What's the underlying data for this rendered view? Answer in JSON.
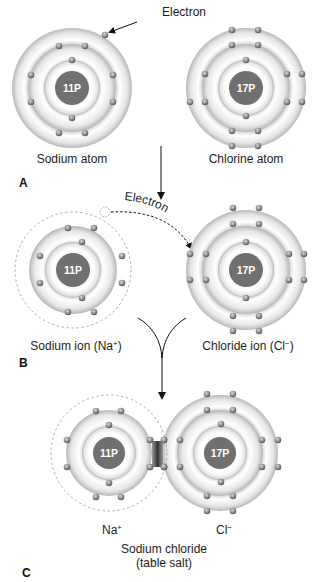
{
  "figure": {
    "panels": [
      {
        "letter": "A",
        "atoms": [
          {
            "label": "Sodium atom",
            "nucleus": "11P",
            "shells": [
              2,
              8,
              1
            ]
          },
          {
            "label": "Chlorine atom",
            "nucleus": "17P",
            "shells": [
              2,
              8,
              7
            ]
          }
        ],
        "callout": "Electron"
      },
      {
        "letter": "B",
        "atoms": [
          {
            "label": "Sodium ion (Na+)",
            "nucleus": "11P",
            "shells": [
              2,
              8
            ]
          },
          {
            "label": "Chloride ion (Cl−)",
            "nucleus": "17P",
            "shells": [
              2,
              8,
              8
            ]
          }
        ],
        "transfer_label": "Electron"
      },
      {
        "letter": "C",
        "atoms": [
          {
            "label": "Na+",
            "nucleus": "11P",
            "shells": [
              2,
              8
            ]
          },
          {
            "label": "Cl−",
            "nucleus": "17P",
            "shells": [
              2,
              8,
              8
            ]
          }
        ],
        "compound_label": "Sodium chloride",
        "compound_sublabel": "(table salt)"
      }
    ]
  },
  "labels": {
    "electron_callout": "Electron",
    "sodium_atom": "Sodium atom",
    "chlorine_atom": "Chlorine atom",
    "panel_a": "A",
    "electron_transfer": "Electron",
    "sodium_ion_text": "Sodium ion (Na",
    "sodium_ion_sup": "+",
    "sodium_ion_close": ")",
    "chloride_ion_text": "Chloride ion (Cl",
    "chloride_ion_sup": "−",
    "chloride_ion_close": ")",
    "panel_b": "B",
    "na_text": "Na",
    "na_sup": "+",
    "cl_text": "Cl",
    "cl_sup": "−",
    "compound": "Sodium chloride",
    "compound_sub": "(table salt)",
    "panel_c": "C"
  },
  "nuclei": {
    "sodium": "11P",
    "chlorine": "17P"
  },
  "colors": {
    "nucleus": "#707070",
    "shell_light": "#ffffff",
    "shell_dark": "#bdbdbd",
    "electron": "#8a8a8a",
    "bond": "#3a3a3a",
    "text": "#1e1e1e"
  }
}
